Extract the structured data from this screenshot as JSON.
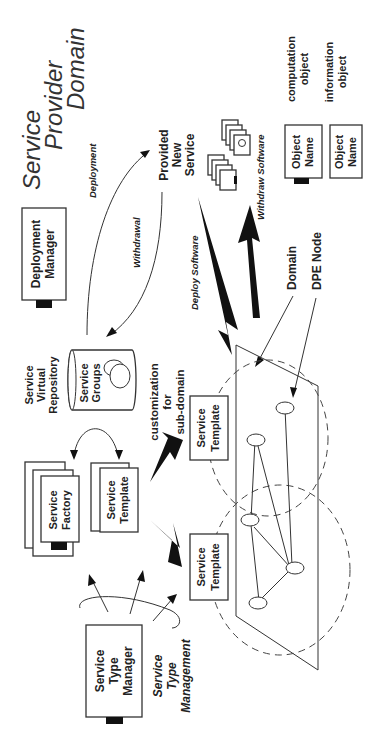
{
  "diagram": {
    "title_lines": [
      "Service",
      "Provider",
      "Domain"
    ],
    "components": {
      "deployment_manager": [
        "Deployment",
        "Manager"
      ],
      "repository_label": [
        "Service",
        "Virtual",
        "Repository"
      ],
      "service_groups": [
        "Service",
        "Groups"
      ],
      "service_factory": [
        "Service",
        "Factory"
      ],
      "service_template_stack": [
        "Service",
        "Template"
      ],
      "service_type_manager": [
        "Service",
        "Type",
        "Manager"
      ],
      "service_template_1": [
        "Service",
        "Template"
      ],
      "service_template_2": [
        "Service",
        "Template"
      ],
      "provided_new_service": [
        "Provided",
        "New",
        "Service"
      ]
    },
    "labels": {
      "deployment": "Deployment",
      "withdrawal": "Withdrawal",
      "deploy_software": "Deploy Software",
      "withdraw_software": "Withdraw Software",
      "customization": [
        "customization",
        "for",
        "sub-domain"
      ],
      "service_type_management": [
        "Service",
        "Type",
        "Management"
      ],
      "domain": "Domain",
      "dpe_node": "DPE Node"
    },
    "legend": {
      "computation": {
        "box": [
          "Object",
          "Name"
        ],
        "desc": [
          "computation",
          "object"
        ]
      },
      "information": {
        "box": [
          "Object",
          "Name"
        ],
        "desc": [
          "information",
          "object"
        ]
      }
    },
    "colors": {
      "ink": "#222222",
      "background": "#ffffff"
    }
  }
}
